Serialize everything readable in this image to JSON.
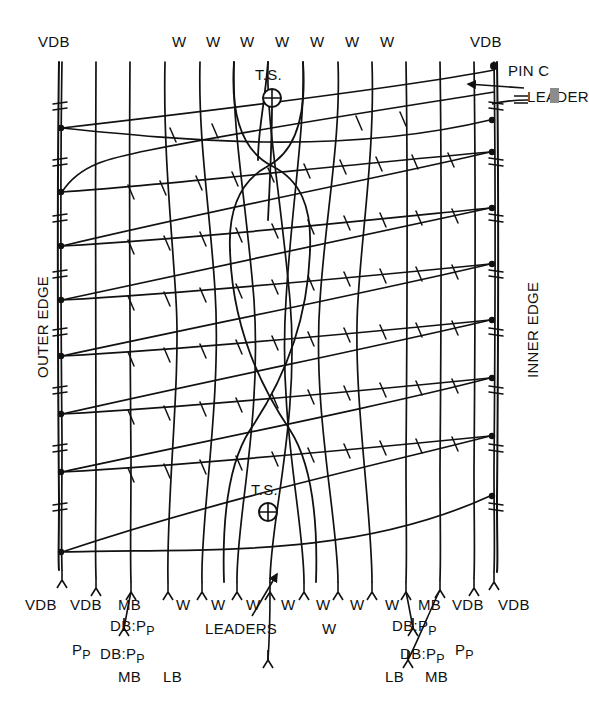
{
  "diagram": {
    "stroke_color": "#111111",
    "background_color": "#ffffff",
    "width": 559,
    "height": 724
  },
  "edges": {
    "left_label": "OUTER EDGE",
    "right_label": "INNER EDGE"
  },
  "top_labels": [
    {
      "text": "VDB",
      "x": 38,
      "y": 33
    },
    {
      "text": "W",
      "x": 172,
      "y": 33
    },
    {
      "text": "W",
      "x": 206,
      "y": 33
    },
    {
      "text": "W",
      "x": 240,
      "y": 33
    },
    {
      "text": "W",
      "x": 275,
      "y": 33
    },
    {
      "text": "W",
      "x": 310,
      "y": 33
    },
    {
      "text": "W",
      "x": 345,
      "y": 33
    },
    {
      "text": "W",
      "x": 380,
      "y": 33
    },
    {
      "text": "VDB",
      "x": 470,
      "y": 33
    }
  ],
  "corner_labels": {
    "pin_c": "PIN C",
    "leader": "LEADER"
  },
  "ts_markers": [
    {
      "label": "T.S.",
      "cx": 272,
      "cy": 98,
      "label_x": 255,
      "label_y": 66
    },
    {
      "label": "T.S.",
      "cx": 268,
      "cy": 512,
      "label_x": 251,
      "label_y": 481
    }
  ],
  "leaders_annotation": {
    "text": "LEADERS",
    "x": 205,
    "y": 620,
    "arrow_from_x": 252,
    "arrow_from_y": 616,
    "arrow_to_x": 277,
    "arrow_to_y": 573
  },
  "bottom_labels_row1": [
    {
      "text": "VDB",
      "x": 25,
      "y": 596
    },
    {
      "text": "VDB",
      "x": 70,
      "y": 596
    },
    {
      "text": "MB",
      "x": 118,
      "y": 596
    },
    {
      "text": "W",
      "x": 176,
      "y": 596
    },
    {
      "text": "W",
      "x": 211,
      "y": 596
    },
    {
      "text": "W",
      "x": 246,
      "y": 596
    },
    {
      "text": "W",
      "x": 281,
      "y": 596
    },
    {
      "text": "W",
      "x": 316,
      "y": 596
    },
    {
      "text": "W",
      "x": 350,
      "y": 596
    },
    {
      "text": "W",
      "x": 385,
      "y": 596
    },
    {
      "text": "MB",
      "x": 418,
      "y": 596
    },
    {
      "text": "VDB",
      "x": 452,
      "y": 596
    },
    {
      "text": "VDB",
      "x": 498,
      "y": 596
    }
  ],
  "bottom_labels_row2": [
    {
      "text": "DB:P",
      "sub": "P",
      "x": 110,
      "y": 617
    },
    {
      "text": "W",
      "sub": "",
      "x": 322,
      "y": 620
    },
    {
      "text": "DB:P",
      "sub": "P",
      "x": 392,
      "y": 617
    }
  ],
  "bottom_labels_row3": [
    {
      "text": "P",
      "sub": "P",
      "x": 72,
      "y": 641
    },
    {
      "text": "DB:P",
      "sub": "P",
      "x": 100,
      "y": 645
    },
    {
      "text": "DB:P",
      "sub": "P",
      "x": 400,
      "y": 645
    },
    {
      "text": "P",
      "sub": "P",
      "x": 455,
      "y": 641
    }
  ],
  "bottom_labels_row4": [
    {
      "text": "MB",
      "x": 118,
      "y": 668
    },
    {
      "text": "LB",
      "x": 163,
      "y": 668
    },
    {
      "text": "LB",
      "x": 385,
      "y": 668
    },
    {
      "text": "MB",
      "x": 425,
      "y": 668
    }
  ]
}
